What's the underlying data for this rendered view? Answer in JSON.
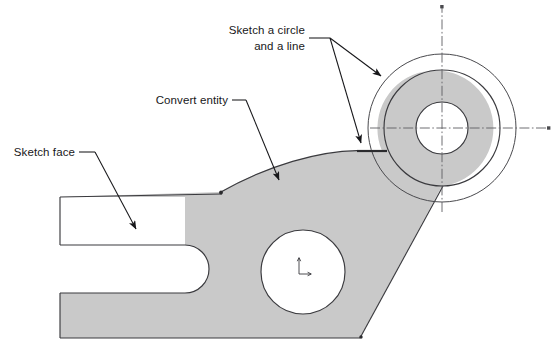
{
  "figure": {
    "kind": "cad-sketch-illustration",
    "background_color": "#ffffff",
    "part_fill_color": "#c9c9c9",
    "edge_color": "#3a3a3e",
    "annotation_color": "#17171a",
    "centerline_color": "#5d5d62"
  },
  "annotations": [
    {
      "id": "sketch-circle-line",
      "line1": "Sketch a circle",
      "line2": "and a line",
      "text_x": 312,
      "text_y": 33,
      "targets": [
        "outer-construction-circle",
        "sketched-line-segment"
      ]
    },
    {
      "id": "convert-entity",
      "line1": "Convert entity",
      "text_x": 228,
      "text_y": 104,
      "targets": [
        "upper-tangent-arc-edge"
      ]
    },
    {
      "id": "sketch-face",
      "line1": "Sketch face",
      "text_x": 75,
      "text_y": 156,
      "targets": [
        "main-body-face"
      ]
    }
  ],
  "geometry": {
    "boss_center": {
      "x": 442,
      "y": 128
    },
    "outer_circle_radius": 74,
    "boss_outer_radius": 58,
    "boss_bore_radius": 26,
    "mid_hole": {
      "x": 303,
      "y": 272,
      "radius": 42
    },
    "slot": {
      "x_end": 185,
      "y_top": 245,
      "y_bottom": 293,
      "radius": 24
    },
    "body_left_x": 60,
    "body_top_y": 197,
    "body_bottom_y": 338
  },
  "icons": {
    "origin_marker": "origin-axis-icon",
    "centerline_cap": "centerline-endpoint-icon"
  }
}
